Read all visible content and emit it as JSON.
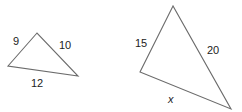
{
  "diagram": {
    "stroke_color": "#6b6b6b",
    "text_color": "#222222",
    "triangles": [
      {
        "id": "small-triangle",
        "vertices": [
          [
            37,
            33
          ],
          [
            8,
            66
          ],
          [
            78,
            76
          ]
        ],
        "sides": [
          {
            "label": "9",
            "x": 13,
            "y": 45
          },
          {
            "label": "10",
            "x": 59,
            "y": 49
          },
          {
            "label": "12",
            "x": 31,
            "y": 87
          }
        ]
      },
      {
        "id": "large-triangle",
        "vertices": [
          [
            173,
            6
          ],
          [
            140,
            72
          ],
          [
            231,
            109
          ]
        ],
        "sides": [
          {
            "label": "15",
            "x": 135,
            "y": 47
          },
          {
            "label": "20",
            "x": 207,
            "y": 54
          },
          {
            "label": "x",
            "x": 168,
            "y": 103
          }
        ]
      }
    ]
  }
}
